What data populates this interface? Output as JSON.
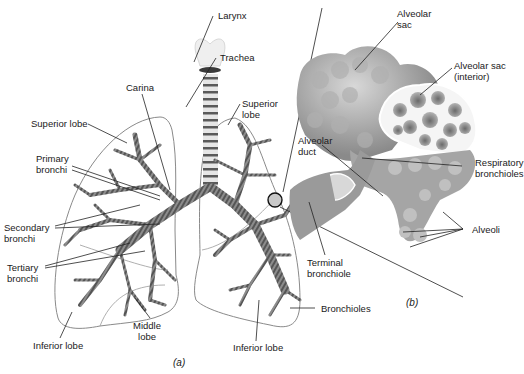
{
  "figure": {
    "panel_a_caption": "(a)",
    "panel_b_caption": "(b)",
    "colors": {
      "bronchi": "#7a7a7a",
      "bronchi_stripe": "#4a4a4a",
      "outline": "#8a8a8a",
      "alveoli": "#9a9a9a",
      "leader": "#222222"
    }
  },
  "labels_a": {
    "larynx": "Larynx",
    "trachea": "Trachea",
    "carina": "Carina",
    "superior_lobe_left": "Superior lobe",
    "superior_lobe_right": "Superior\nlobe",
    "primary_bronchi": "Primary\nbronchi",
    "secondary_bronchi": "Secondary\nbronchi",
    "tertiary_bronchi": "Tertiary\nbronchi",
    "middle_lobe": "Middle\nlobe",
    "inferior_lobe_left": "Inferior lobe",
    "inferior_lobe_right": "Inferior lobe",
    "bronchioles": "Bronchioles"
  },
  "labels_b": {
    "alveolar_sac": "Alveolar\nsac",
    "alveolar_sac_interior": "Alveolar sac\n(interior)",
    "alveolar_duct": "Alveolar\nduct",
    "respiratory_bronchioles": "Respiratory\nbronchioles",
    "alveoli": "Alveoli",
    "terminal_bronchiole": "Terminal\nbronchiole"
  }
}
